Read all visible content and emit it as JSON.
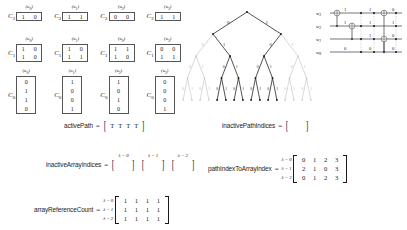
{
  "c_arrays": {
    "rows": [
      {
        "label": "C",
        "sub": "2",
        "blocks": [
          {
            "head": "u",
            "head_sub": "0",
            "lines": [
              [
                "1",
                "0"
              ]
            ]
          },
          {
            "head": "u",
            "head_sub": "1",
            "lines": [
              [
                "1",
                "1"
              ]
            ]
          },
          {
            "head": "u",
            "head_sub": "2",
            "lines": [
              [
                "0",
                "0"
              ]
            ]
          },
          {
            "head": "u",
            "head_sub": "3",
            "lines": [
              [
                "1",
                "1"
              ]
            ]
          }
        ]
      },
      {
        "label": "C",
        "sub": "1",
        "blocks": [
          {
            "head": "u",
            "head_sub": "0",
            "lines": [
              [
                "1",
                "0"
              ],
              [
                "1",
                "0"
              ]
            ]
          },
          {
            "head": "u",
            "head_sub": "1",
            "lines": [
              [
                "1",
                "0"
              ],
              [
                "1",
                "1"
              ]
            ]
          },
          {
            "head": "u",
            "head_sub": "0",
            "lines": [
              [
                "1",
                "1"
              ],
              [
                "1",
                "0"
              ]
            ]
          },
          {
            "head": "u",
            "head_sub": "3",
            "lines": [
              [
                "0",
                "0"
              ],
              [
                "1",
                "1"
              ]
            ]
          }
        ]
      },
      {
        "label": "C",
        "sub": "0",
        "blocks": [
          {
            "head": "u",
            "head_sub": "0",
            "lines": [
              [
                "0"
              ],
              [
                "1"
              ],
              [
                "1"
              ],
              [
                "0"
              ]
            ]
          },
          {
            "head": "u",
            "head_sub": "1",
            "lines": [
              [
                "1"
              ],
              [
                "0"
              ],
              [
                "0"
              ],
              [
                "1"
              ]
            ]
          },
          {
            "head": "u",
            "head_sub": "2",
            "lines": [
              [
                "1"
              ],
              [
                "0"
              ],
              [
                "1"
              ],
              [
                "0"
              ]
            ]
          },
          {
            "head": "u",
            "head_sub": "3",
            "lines": [
              [
                "0"
              ],
              [
                "0"
              ],
              [
                "0"
              ],
              [
                "1"
              ]
            ]
          }
        ]
      }
    ]
  },
  "tree": {
    "edge_labels": [
      "0",
      "1"
    ]
  },
  "circuit": {
    "wires": [
      {
        "label": "w",
        "sub": "3"
      },
      {
        "label": "w",
        "sub": "2"
      },
      {
        "label": "w",
        "sub": "1"
      },
      {
        "label": "w",
        "sub": "0"
      }
    ],
    "bit_labels": [
      {
        "x": 28,
        "y": 9,
        "text": "1"
      },
      {
        "x": 53,
        "y": 9,
        "text": "1"
      },
      {
        "x": 76,
        "y": 9,
        "text": "0"
      },
      {
        "x": 28,
        "y": 22,
        "text": "1"
      },
      {
        "x": 53,
        "y": 22,
        "text": "1"
      },
      {
        "x": 76,
        "y": 22,
        "text": "1"
      },
      {
        "x": 53,
        "y": 35,
        "text": "1"
      },
      {
        "x": 76,
        "y": 35,
        "text": "0"
      },
      {
        "x": 28,
        "y": 48,
        "text": "0"
      },
      {
        "x": 53,
        "y": 48,
        "text": "0"
      },
      {
        "x": 76,
        "y": 48,
        "text": "0"
      }
    ]
  },
  "active_path": {
    "name": "activePath",
    "equals": "=",
    "values": [
      "T",
      "T",
      "T",
      "T"
    ]
  },
  "inactive_path_indices": {
    "name": "inactivePathIndices",
    "equals": "=",
    "values": []
  },
  "inactive_array_indices": {
    "name": "inactiveArrayIndices",
    "equals": "=",
    "groups": [
      {
        "lambda_label": "λ = 0",
        "values": []
      },
      {
        "lambda_label": "λ = 1",
        "values": []
      },
      {
        "lambda_label": "λ = 2",
        "values": []
      }
    ]
  },
  "path_index_to_array_index": {
    "name": "pathIndexToArrayIndex",
    "equals": "=",
    "row_labels": [
      "λ = 0",
      "λ = 1",
      "λ = 2"
    ],
    "rows": [
      [
        "0",
        "1",
        "2",
        "3"
      ],
      [
        "2",
        "1",
        "0",
        "3"
      ],
      [
        "0",
        "1",
        "2",
        "3"
      ]
    ]
  },
  "array_reference_count": {
    "name": "arrayReferenceCount",
    "equals": "=",
    "row_labels": [
      "λ = 0",
      "λ = 1",
      "λ = 2"
    ],
    "rows": [
      [
        "1",
        "1",
        "1",
        "1"
      ],
      [
        "1",
        "1",
        "1",
        "1"
      ],
      [
        "1",
        "1",
        "1",
        "1"
      ]
    ]
  },
  "colors": {
    "active_edge": "#1a1a1a",
    "inactive_edge": "#b9b9b9",
    "box_border": "#555555",
    "background": "#ffffff"
  }
}
